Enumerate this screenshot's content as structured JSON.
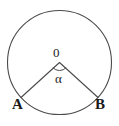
{
  "diagram": {
    "type": "geometry-figure",
    "background_color": "#ffffff",
    "stroke_color": "#4a4a4a",
    "text_color": "#1a1a1a",
    "canvas": {
      "width": 119,
      "height": 126
    },
    "circle": {
      "name": "circle-outline",
      "center_x": 59.5,
      "center_y": 62.5,
      "radius": 52,
      "stroke_width": 1.1,
      "fill": "none"
    },
    "center_point": {
      "label": "0",
      "x": 59.5,
      "y": 62.5
    },
    "angle": {
      "label": "α",
      "vertex_x": 59.5,
      "vertex_y": 62.5,
      "arc_radius": 9,
      "marker_type": "single-arc"
    },
    "radii": [
      {
        "name": "radius-to-a",
        "from_x": 59.5,
        "from_y": 62.5,
        "to_x": 21.0,
        "to_y": 97.5
      },
      {
        "name": "radius-to-b",
        "from_x": 59.5,
        "from_y": 62.5,
        "to_x": 98.0,
        "to_y": 97.5
      }
    ],
    "points": [
      {
        "label": "A",
        "x": 21.0,
        "y": 97.5,
        "label_x": 12,
        "label_y": 97
      },
      {
        "label": "B",
        "x": 98.0,
        "y": 97.5,
        "label_x": 95,
        "label_y": 97
      }
    ]
  }
}
